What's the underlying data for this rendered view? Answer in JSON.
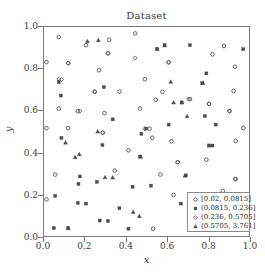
{
  "chart_data": {
    "type": "scatter",
    "title": "Dataset",
    "xlabel": "x",
    "ylabel": "y",
    "xlim": [
      0.0,
      1.0
    ],
    "ylim": [
      0.0,
      1.0
    ],
    "xticks": [
      "0.0",
      "0.2",
      "0.4",
      "0.6",
      "0.8",
      "1.0"
    ],
    "yticks": [
      "0.0",
      "0.2",
      "0.4",
      "0.6",
      "0.8",
      "1.0"
    ],
    "xtick_values": [
      0.0,
      0.2,
      0.4,
      0.6,
      0.8,
      1.0
    ],
    "ytick_values": [
      0.0,
      0.2,
      0.4,
      0.6,
      0.8,
      1.0
    ],
    "grid": false,
    "legend_position": "lower right",
    "legend_title": "",
    "marker_color": "#4a4a4a",
    "frame_color": "#7a7a7a",
    "series": [
      {
        "name": "[0.02, 0.0815]",
        "marker": "circle-open",
        "points": [
          [
            0.012,
            0.832
          ],
          [
            0.012,
            0.516
          ],
          [
            0.012,
            0.175
          ],
          [
            0.055,
            0.294
          ],
          [
            0.072,
            0.952
          ],
          [
            0.072,
            0.609
          ],
          [
            0.118,
            0.827
          ],
          [
            0.118,
            0.516
          ],
          [
            0.165,
            0.597
          ],
          [
            0.205,
            0.913
          ],
          [
            0.247,
            0.691
          ],
          [
            0.268,
            0.793
          ],
          [
            0.287,
            0.494
          ],
          [
            0.295,
            0.588
          ],
          [
            0.312,
            0.874
          ],
          [
            0.318,
            0.939
          ],
          [
            0.345,
            0.313
          ],
          [
            0.368,
            0.691
          ],
          [
            0.412,
            0.41
          ],
          [
            0.445,
            0.969
          ],
          [
            0.468,
            0.61
          ],
          [
            0.492,
            0.75
          ],
          [
            0.515,
            0.513
          ],
          [
            0.528,
            0.47
          ],
          [
            0.532,
            0.035
          ],
          [
            0.545,
            0.652
          ],
          [
            0.568,
            0.294
          ],
          [
            0.578,
            0.69
          ],
          [
            0.608,
            0.831
          ],
          [
            0.622,
            0.453
          ],
          [
            0.632,
            0.196
          ],
          [
            0.652,
            0.353
          ],
          [
            0.712,
            0.655
          ],
          [
            0.792,
            0.365
          ],
          [
            0.805,
            0.632
          ],
          [
            0.822,
            0.869
          ],
          [
            0.872,
            0.216
          ],
          [
            0.878,
            0.909
          ],
          [
            0.905,
            0.598
          ],
          [
            0.925,
            0.694
          ],
          [
            0.932,
            0.81
          ],
          [
            0.935,
            0.455
          ],
          [
            0.935,
            0.272
          ],
          [
            0.972,
            0.517
          ]
        ]
      },
      {
        "name": "(0.0815, 0.236]",
        "marker": "square-small",
        "points": [
          [
            0.048,
            0.038
          ],
          [
            0.055,
            0.192
          ],
          [
            0.072,
            0.736
          ],
          [
            0.082,
            0.672
          ],
          [
            0.085,
            0.469
          ],
          [
            0.118,
            0.038
          ],
          [
            0.165,
            0.158
          ],
          [
            0.168,
            0.249
          ],
          [
            0.175,
            0.285
          ],
          [
            0.205,
            0.155
          ],
          [
            0.258,
            0.259
          ],
          [
            0.272,
            0.074
          ],
          [
            0.285,
            0.435
          ],
          [
            0.292,
            0.712
          ],
          [
            0.312,
            0.072
          ],
          [
            0.335,
            0.558
          ],
          [
            0.368,
            0.133
          ],
          [
            0.412,
            0.035
          ],
          [
            0.432,
            0.235
          ],
          [
            0.468,
            0.38
          ],
          [
            0.475,
            0.489
          ],
          [
            0.498,
            0.514
          ],
          [
            0.522,
            0.241
          ],
          [
            0.552,
            0.895
          ],
          [
            0.588,
            0.913
          ],
          [
            0.608,
            0.533
          ],
          [
            0.668,
            0.155
          ],
          [
            0.672,
            0.639
          ],
          [
            0.692,
            0.29
          ],
          [
            0.712,
            0.913
          ],
          [
            0.772,
            0.731
          ],
          [
            0.785,
            0.574
          ],
          [
            0.792,
            0.778
          ],
          [
            0.805,
            0.433
          ],
          [
            0.822,
            0.433
          ],
          [
            0.838,
            0.533
          ],
          [
            0.972,
            0.894
          ]
        ]
      },
      {
        "name": "(0.236, 0.5705]",
        "marker": "diamond-open",
        "points": [
          [
            0.072,
            0.751
          ],
          [
            0.085,
            0.748
          ],
          [
            0.118,
            0.827
          ],
          [
            0.175,
            0.597
          ],
          [
            0.248,
            0.689
          ],
          [
            0.285,
            0.494
          ],
          [
            0.312,
            0.874
          ],
          [
            0.445,
            0.852
          ],
          [
            0.492,
            0.513
          ],
          [
            0.608,
            0.831
          ],
          [
            0.652,
            0.353
          ],
          [
            0.705,
            0.655
          ],
          [
            0.805,
            0.632
          ],
          [
            0.905,
            0.598
          ],
          [
            0.932,
            0.272
          ]
        ]
      },
      {
        "name": "(0.5705, 3.761]",
        "marker": "triangle",
        "points": [
          [
            0.105,
            0.447
          ],
          [
            0.152,
            0.377
          ],
          [
            0.172,
            0.391
          ],
          [
            0.262,
            0.5
          ],
          [
            0.298,
            0.281
          ],
          [
            0.435,
            0.115
          ],
          [
            0.465,
            0.095
          ],
          [
            0.618,
            0.738
          ],
          [
            0.632,
            0.639
          ],
          [
            0.672,
            0.639
          ],
          [
            0.688,
            0.289
          ],
          [
            0.698,
            0.573
          ],
          [
            0.775,
            0.733
          ],
          [
            0.212,
            0.932
          ],
          [
            0.265,
            0.937
          ],
          [
            0.552,
            0.895
          ],
          [
            0.588,
            0.912
          ],
          [
            0.118,
            0.038
          ],
          [
            0.335,
            0.28
          ],
          [
            0.472,
            0.38
          ],
          [
            0.805,
            0.433
          ]
        ]
      }
    ]
  }
}
